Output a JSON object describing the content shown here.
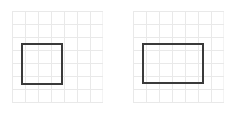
{
  "canvas": {
    "width": 235,
    "height": 115,
    "background": "#ffffff"
  },
  "style": {
    "grid_line_color": "#e9e9e9",
    "grid_line_width": 1,
    "shape_stroke_color": "#3a3a3a",
    "shape_stroke_width": 2,
    "shape_fill": "none"
  },
  "panels": [
    {
      "name": "left-panel",
      "grid": {
        "columns": 7,
        "rows": 7,
        "cell_width_px": 13,
        "cell_height_px": 13,
        "origin_x_px": 12,
        "origin_y_px": 11,
        "width_px": 91,
        "height_px": 92
      },
      "shape": {
        "type": "rectangle",
        "label": "square",
        "x_cells": 0.8,
        "y_cells": 2.5,
        "width_cells": 3.1,
        "height_cells": 3.1,
        "x_px": 10,
        "y_px": 33,
        "width_px": 40,
        "height_px": 40
      }
    },
    {
      "name": "right-panel",
      "grid": {
        "columns": 7,
        "rows": 7,
        "cell_width_px": 13,
        "cell_height_px": 13,
        "origin_x_px": 133,
        "origin_y_px": 11,
        "width_px": 91,
        "height_px": 92
      },
      "shape": {
        "type": "rectangle",
        "label": "rectangle",
        "x_cells": 0.8,
        "y_cells": 2.5,
        "width_cells": 4.6,
        "height_cells": 3.1,
        "x_px": 10,
        "y_px": 33,
        "width_px": 60,
        "height_px": 39
      }
    }
  ]
}
